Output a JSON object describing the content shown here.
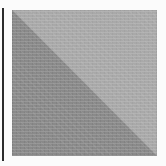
{
  "canvas": {
    "width": 166,
    "height": 166,
    "background_color": "#fbfbfb"
  },
  "left_rule": {
    "name": "vertical-rule",
    "color": "#2b2b2b",
    "x": 2,
    "y": 8,
    "width": 2,
    "height": 153
  },
  "swatch": {
    "name": "two-tone-diagonal-swatch",
    "x": 12,
    "y": 10,
    "width": 145,
    "height": 146,
    "split": "diagonal-top-left-to-bottom-right",
    "light_triangle": {
      "position": "upper-right",
      "color": "#a9a9a9"
    },
    "dark_triangle": {
      "position": "lower-left",
      "color": "#8a8a8a"
    }
  }
}
